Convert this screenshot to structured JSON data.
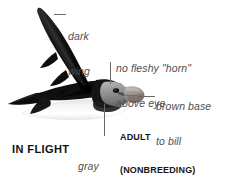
{
  "plate": {
    "subject": "puffin-in-flight",
    "width": 236,
    "height": 186,
    "background_color": "#ffffff"
  },
  "annotations": {
    "dark_wing": {
      "line1": "dark",
      "line2": "wing",
      "leader": "horizontal"
    },
    "no_horn": {
      "line1": "no fleshy \"horn\"",
      "line2": "above eye",
      "leader": "vertical"
    },
    "brown_base": {
      "line1": "brown base",
      "line2": "to bill",
      "leader": "horizontal"
    },
    "gray_face": {
      "line1": "gray",
      "line2": "face",
      "leader": "vertical"
    }
  },
  "caption": {
    "line1": "ADULT",
    "line2": "(NONBREEDING)"
  },
  "pose_label": "IN FLIGHT",
  "colors": {
    "text_callout": "#4f4f4f",
    "text_caption": "#151515",
    "text_pose": "#111111",
    "leader_line": "#6a6a6a",
    "wing_dark": "#1a1a1a",
    "body_white": "#fbfbfb",
    "face_gray": "#8e8e8e",
    "bill_brown": "#9b9189",
    "background": "#ffffff"
  }
}
